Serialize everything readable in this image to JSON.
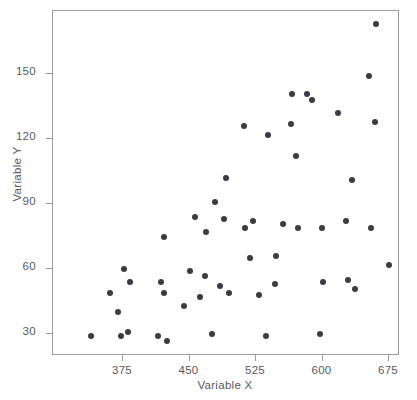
{
  "chart_data": {
    "type": "scatter",
    "title": "",
    "xlabel": "Variable X",
    "ylabel": "Variable Y",
    "xlim": [
      330,
      690
    ],
    "ylim": [
      18,
      178
    ],
    "xticks": [
      375,
      450,
      525,
      600,
      675
    ],
    "yticks": [
      30,
      60,
      90,
      120,
      150
    ],
    "xtick_labels": [
      "375",
      "450",
      "525",
      "600",
      "675"
    ],
    "ytick_labels": [
      "30",
      "60",
      "90",
      "120",
      "150"
    ],
    "grid": false,
    "legend": null,
    "marker_color": "#3b3b44",
    "frame_color": "#9b9b9b",
    "text_color": "#59595f",
    "background": "#ffffff",
    "series": [
      {
        "name": "Variable Y vs Variable X",
        "points": [
          [
            339,
            29
          ],
          [
            360,
            49
          ],
          [
            369,
            40
          ],
          [
            373,
            29
          ],
          [
            376,
            60
          ],
          [
            381,
            31
          ],
          [
            383,
            54
          ],
          [
            414,
            29
          ],
          [
            418,
            54
          ],
          [
            421,
            75
          ],
          [
            421,
            49
          ],
          [
            425,
            27
          ],
          [
            444,
            43
          ],
          [
            450,
            59
          ],
          [
            456,
            84
          ],
          [
            462,
            47
          ],
          [
            467,
            57
          ],
          [
            469,
            77
          ],
          [
            475,
            30
          ],
          [
            479,
            91
          ],
          [
            484,
            52
          ],
          [
            489,
            83
          ],
          [
            491,
            102
          ],
          [
            494,
            49
          ],
          [
            511,
            126
          ],
          [
            513,
            79
          ],
          [
            518,
            65
          ],
          [
            522,
            82
          ],
          [
            528,
            48
          ],
          [
            536,
            29
          ],
          [
            539,
            122
          ],
          [
            546,
            53
          ],
          [
            548,
            66
          ],
          [
            555,
            81
          ],
          [
            564,
            127
          ],
          [
            566,
            141
          ],
          [
            570,
            112
          ],
          [
            572,
            79
          ],
          [
            582,
            141
          ],
          [
            588,
            138
          ],
          [
            597,
            30
          ],
          [
            599,
            79
          ],
          [
            601,
            54
          ],
          [
            617,
            132
          ],
          [
            626,
            82
          ],
          [
            629,
            55
          ],
          [
            633,
            101
          ],
          [
            637,
            51
          ],
          [
            652,
            149
          ],
          [
            655,
            79
          ],
          [
            659,
            128
          ],
          [
            660,
            173
          ],
          [
            675,
            62
          ]
        ]
      }
    ]
  },
  "axes": {
    "y_title": "Variable Y",
    "x_title": "Variable X"
  }
}
